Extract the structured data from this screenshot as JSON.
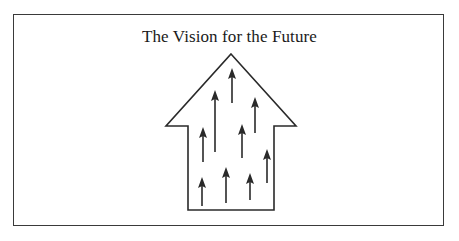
{
  "diagram": {
    "title": "The Vision for the Future",
    "colors": {
      "stroke": "#2a2a2a",
      "frame": "#3a3a3a",
      "background": "#ffffff",
      "text": "#1a1a1a"
    },
    "house_shape": {
      "icon": "up-arrow-house-outline",
      "points": [
        [
          231,
          54
        ],
        [
          296,
          126
        ],
        [
          274,
          126
        ],
        [
          274,
          210
        ],
        [
          188,
          210
        ],
        [
          188,
          126
        ],
        [
          166,
          126
        ]
      ]
    },
    "arrows": [
      {
        "name": "arrow-top-center",
        "x": 232,
        "tip_y": 68,
        "tail_y": 103
      },
      {
        "name": "arrow-tall-left",
        "x": 215,
        "tip_y": 90,
        "tail_y": 152
      },
      {
        "name": "arrow-upper-right",
        "x": 255,
        "tip_y": 97,
        "tail_y": 133
      },
      {
        "name": "arrow-mid-left",
        "x": 203,
        "tip_y": 127,
        "tail_y": 162
      },
      {
        "name": "arrow-mid-center",
        "x": 242,
        "tip_y": 124,
        "tail_y": 158
      },
      {
        "name": "arrow-lower-right",
        "x": 267,
        "tip_y": 149,
        "tail_y": 183
      },
      {
        "name": "arrow-bottom-left",
        "x": 202,
        "tip_y": 177,
        "tail_y": 206
      },
      {
        "name": "arrow-bottom-center",
        "x": 226,
        "tip_y": 167,
        "tail_y": 203
      },
      {
        "name": "arrow-bottom-right",
        "x": 250,
        "tip_y": 173,
        "tail_y": 200
      }
    ]
  }
}
